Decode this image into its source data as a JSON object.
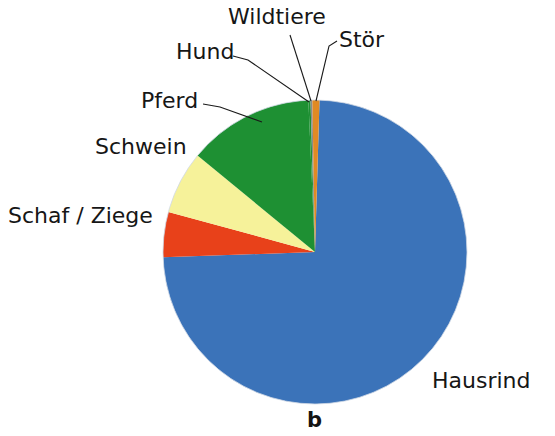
{
  "figure": {
    "caption": "b",
    "type": "pie-chart"
  },
  "labels": {
    "wildtiere": "Wildtiere",
    "stoer": "Stör",
    "hund": "Hund",
    "pferd": "Pferd",
    "schwein": "Schwein",
    "schaf_ziege": "Schaf / Ziege",
    "hausrind": "Hausrind"
  },
  "colors": {
    "hausrind": "#3b73b9",
    "schaf_ziege": "#e8411a",
    "schwein": "#f6f29a",
    "pferd": "#1e9033",
    "hund": "#3b73b9",
    "wildtiere": "#8a8a8a",
    "stoer": "#e08a24",
    "leader_line": "#1a1a1a",
    "text": "#161616",
    "background": "#ffffff"
  },
  "chart_data": {
    "type": "pie",
    "title": "",
    "subtitle": "",
    "xlabel": "",
    "ylabel": "",
    "annotations": [
      "b"
    ],
    "legend_position": "none",
    "labels_position": "outside-with-leader-lines",
    "grid": false,
    "start_angle_deg": 0,
    "direction": "clockwise",
    "categories": [
      "Hausrind",
      "Schaf / Ziege",
      "Schwein",
      "Pferd",
      "Hund",
      "Wildtiere",
      "Stör"
    ],
    "values": [
      74.0,
      4.8,
      6.7,
      7.8,
      0.6,
      0.6,
      0.5
    ],
    "unit": "percent",
    "slices": [
      {
        "label": "Hausrind",
        "value": 74.0,
        "color": "#3b73b9",
        "start_deg": 1.7,
        "end_deg": 268.0
      },
      {
        "label": "Schaf / Ziege",
        "value": 4.8,
        "color": "#e8411a",
        "start_deg": 268.0,
        "end_deg": 285.3
      },
      {
        "label": "Schwein",
        "value": 6.7,
        "color": "#f6f29a",
        "start_deg": 285.3,
        "end_deg": 309.4
      },
      {
        "label": "Pferd",
        "value": 7.8,
        "color": "#1e9033",
        "start_deg": 309.4,
        "end_deg": 357.5
      },
      {
        "label": "Hund",
        "value": 0.6,
        "color": "#1e9033",
        "start_deg": 357.5,
        "end_deg": 358.3
      },
      {
        "label": "Wildtiere",
        "value": 0.6,
        "color": "#8a8a8a",
        "start_deg": 358.3,
        "end_deg": 359.0
      },
      {
        "label": "Stör",
        "value": 0.5,
        "color": "#e08a24",
        "start_deg": 359.0,
        "end_deg": 361.7
      }
    ],
    "geometry": {
      "center_x": 315,
      "center_y": 252,
      "radius": 152
    }
  }
}
